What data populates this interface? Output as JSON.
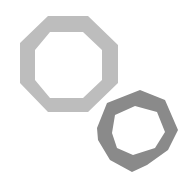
{
  "figure": {
    "shapes": [
      {
        "name": "large-octagon-ring",
        "color": "#bdbdbd",
        "outer": "48,16 88,16 118,45 118,83 88,112 48,112 20,83 20,43",
        "inner": "50,32 83,32 102,50 102,80 83,98 50,98 35,80 35,50"
      },
      {
        "name": "small-octagon-ring",
        "color": "#8a8a8a",
        "outer": "140,90 165,100 178,130 168,150 147,165 132,172 110,160 98,140 97,128 107,103",
        "inner": "135,106 157,112 165,132 155,148 133,155 117,148 112,133 115,115"
      }
    ]
  }
}
